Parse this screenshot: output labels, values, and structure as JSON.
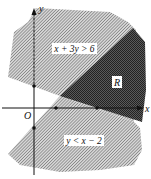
{
  "diagram": {
    "axes": {
      "x_label": "x",
      "y_label": "y",
      "origin_label": "O"
    },
    "regions": [
      {
        "id": "upper",
        "label": "x + 3y > 6",
        "fill": "light-hatch"
      },
      {
        "id": "R",
        "label": "R",
        "fill": "dark-crosshatch"
      },
      {
        "id": "lower",
        "label": "y < x − 2",
        "fill": "light-hatch"
      }
    ],
    "points": [
      {
        "axis": "y",
        "value": 2
      },
      {
        "axis": "y",
        "value": -2
      },
      {
        "axis": "x",
        "value": 2
      },
      {
        "axis": "x",
        "value": 6
      }
    ],
    "colors": {
      "hatch_light": "#8a8a8a",
      "hatch_dark": "#3a3a3a",
      "axis": "#111111",
      "label_bg": "#ffffff"
    }
  }
}
